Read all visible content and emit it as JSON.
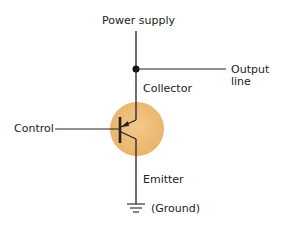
{
  "diagram": {
    "type": "transistor-schematic",
    "labels": {
      "power_supply": "Power supply",
      "output_line_1": "Output",
      "output_line_2": "line",
      "collector": "Collector",
      "control": "Control",
      "emitter": "Emitter",
      "ground": "(Ground)"
    },
    "colors": {
      "transistor_fill": "#f0c07a",
      "transistor_edge": "#e2ab60",
      "wire": "#222222",
      "background": "#ffffff"
    }
  }
}
